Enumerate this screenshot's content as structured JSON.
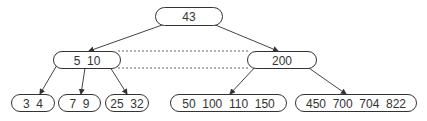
{
  "diagram": {
    "type": "b-tree",
    "nodes": [
      {
        "id": "root",
        "label": "43",
        "x": 155,
        "y": 7,
        "w": 67,
        "h": 18
      },
      {
        "id": "left-internal",
        "label": "5  10",
        "x": 53,
        "y": 51,
        "w": 67,
        "h": 17
      },
      {
        "id": "right-internal",
        "label": "200",
        "x": 247,
        "y": 51,
        "w": 69,
        "h": 17
      },
      {
        "id": "leaf-1",
        "label": "3  4",
        "x": 11,
        "y": 94,
        "w": 43,
        "h": 17
      },
      {
        "id": "leaf-2",
        "label": "7  9",
        "x": 58,
        "y": 94,
        "w": 42,
        "h": 17
      },
      {
        "id": "leaf-3",
        "label": "25  32",
        "x": 105,
        "y": 94,
        "w": 43,
        "h": 17
      },
      {
        "id": "leaf-4",
        "label": "50  100  110  150",
        "x": 170,
        "y": 94,
        "w": 116,
        "h": 17
      },
      {
        "id": "leaf-5",
        "label": "450  700  704  822",
        "x": 295,
        "y": 94,
        "w": 121,
        "h": 17
      }
    ],
    "edges": [
      {
        "from": "root",
        "to": "left-internal",
        "x1": 165,
        "y1": 24,
        "x2": 89,
        "y2": 51
      },
      {
        "from": "root",
        "to": "right-internal",
        "x1": 213,
        "y1": 24,
        "x2": 278,
        "y2": 51
      },
      {
        "from": "left-internal",
        "to": "leaf-1",
        "x1": 57,
        "y1": 65,
        "x2": 40,
        "y2": 94
      },
      {
        "from": "left-internal",
        "to": "leaf-2",
        "x1": 85,
        "y1": 68,
        "x2": 81,
        "y2": 94
      },
      {
        "from": "left-internal",
        "to": "leaf-3",
        "x1": 110,
        "y1": 67,
        "x2": 127,
        "y2": 94
      },
      {
        "from": "right-internal",
        "to": "leaf-4",
        "x1": 256,
        "y1": 66,
        "x2": 230,
        "y2": 94
      },
      {
        "from": "right-internal",
        "to": "leaf-5",
        "x1": 306,
        "y1": 66,
        "x2": 346,
        "y2": 94
      }
    ],
    "sibling_links": [
      {
        "from": "left-internal",
        "to": "right-internal",
        "x1": 118,
        "y1": 51,
        "x2": 250,
        "y2": 51
      },
      {
        "from": "left-internal",
        "to": "right-internal",
        "x1": 118,
        "y1": 68,
        "x2": 250,
        "y2": 68
      }
    ],
    "colors": {
      "stroke": "#333333",
      "text": "#333333",
      "background": "#ffffff"
    }
  }
}
